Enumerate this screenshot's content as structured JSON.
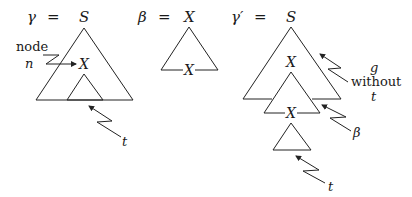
{
  "diagram": {
    "gamma": {
      "lhs": "γ",
      "eq": "=",
      "root": "S",
      "inner_node": "X",
      "node_label_line1": "node",
      "node_label_line2": "n",
      "subtree_label": "t"
    },
    "beta": {
      "lhs": "β",
      "eq": "=",
      "root": "X",
      "foot": "X"
    },
    "gamma_prime": {
      "lhs": "γ′",
      "eq": "=",
      "root": "S",
      "inner_node": "X",
      "foot": "X",
      "g_label_line1": "g",
      "g_label_line2": "without",
      "g_label_line3": "t",
      "beta_label": "β",
      "subtree_label": "t"
    }
  }
}
